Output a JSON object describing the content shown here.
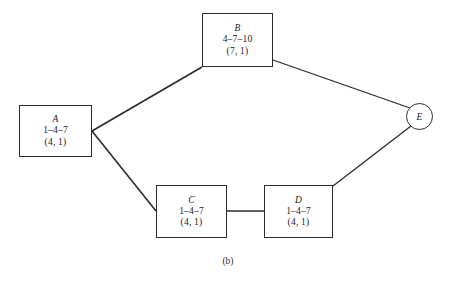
{
  "figure": {
    "caption": "(b)",
    "background_color": "#ffffff",
    "stroke_color": "#2b2b2b"
  },
  "diagram": {
    "type": "activity-network-diagram",
    "nodes": [
      {
        "id": "A",
        "shape": "rectangle",
        "label": "A",
        "times": "1–4–7",
        "params": "(4, 1)"
      },
      {
        "id": "B",
        "shape": "rectangle",
        "label": "B",
        "times": "4–7–10",
        "params": "(7, 1)"
      },
      {
        "id": "C",
        "shape": "rectangle",
        "label": "C",
        "times": "1–4–7",
        "params": "(4, 1)"
      },
      {
        "id": "D",
        "shape": "rectangle",
        "label": "D",
        "times": "1–4–7",
        "params": "(4, 1)"
      },
      {
        "id": "E",
        "shape": "circle",
        "label": "E",
        "times": "",
        "params": ""
      }
    ],
    "edges": [
      {
        "from": "A",
        "to": "B"
      },
      {
        "from": "A",
        "to": "C"
      },
      {
        "from": "B",
        "to": "E"
      },
      {
        "from": "C",
        "to": "D"
      },
      {
        "from": "D",
        "to": "E"
      }
    ]
  }
}
